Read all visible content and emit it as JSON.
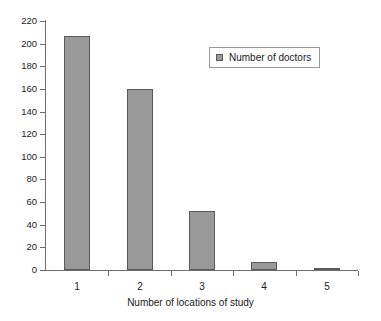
{
  "chart_data": {
    "type": "bar",
    "title": "",
    "subtitle": "",
    "categories": [
      "1",
      "2",
      "3",
      "4",
      "5"
    ],
    "values": [
      207,
      160,
      52,
      7,
      2
    ],
    "series": [
      {
        "name": "Number of doctors",
        "values": [
          207,
          160,
          52,
          7,
          2
        ]
      }
    ],
    "xlabel": "Number of locations of study",
    "ylabel": "",
    "ylim": [
      0,
      220
    ],
    "ytick_step": 20,
    "yticks": [
      0,
      20,
      40,
      60,
      80,
      100,
      120,
      140,
      160,
      180,
      200,
      220
    ],
    "grid": false,
    "legend": {
      "position": "top-right",
      "entries": [
        {
          "label": "Number of doctors",
          "marker": "square-swatch",
          "color": "#999999"
        }
      ]
    },
    "colors": {
      "bar_fill": "#999999",
      "bar_border": "#5a5a5a",
      "axis": "#6e6e6e",
      "text": "#1a1a1a",
      "background": "#ffffff",
      "legend_border": "#9a9a9a"
    }
  }
}
